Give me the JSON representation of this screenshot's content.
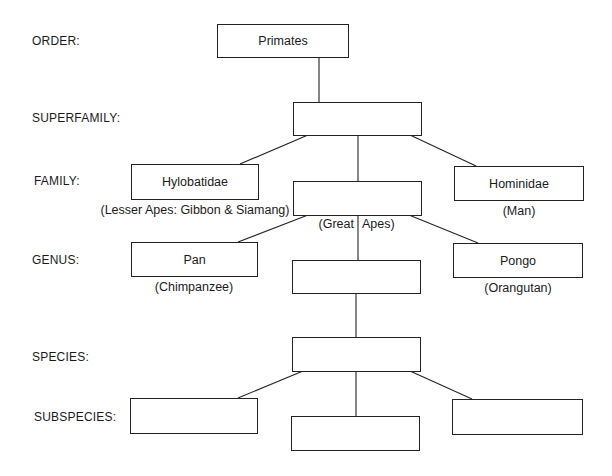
{
  "ranks": [
    {
      "id": "order",
      "label": "ORDER:"
    },
    {
      "id": "superfamily",
      "label": "SUPERFAMILY:"
    },
    {
      "id": "family",
      "label": "FAMILY:"
    },
    {
      "id": "genus",
      "label": "GENUS:"
    },
    {
      "id": "species",
      "label": "SPECIES:"
    },
    {
      "id": "subspecies",
      "label": "SUBSPECIES:"
    }
  ],
  "nodes": {
    "primates": {
      "label": "Primates",
      "caption": ""
    },
    "superfamily": {
      "label": "",
      "caption": ""
    },
    "hylobatidae": {
      "label": "Hylobatidae",
      "caption": "(Lesser Apes: Gibbon & Siamang)"
    },
    "great_apes": {
      "label": "",
      "caption_left": "(Great",
      "caption_right": "Apes)"
    },
    "hominidae": {
      "label": "Hominidae",
      "caption": "(Man)"
    },
    "pan": {
      "label": "Pan",
      "caption": "(Chimpanzee)"
    },
    "genus_blank": {
      "label": "",
      "caption": ""
    },
    "pongo": {
      "label": "Pongo",
      "caption": "(Orangutan)"
    },
    "species_blank": {
      "label": "",
      "caption": ""
    },
    "subspecies_left": {
      "label": "",
      "caption": ""
    },
    "subspecies_middle": {
      "label": "",
      "caption": ""
    },
    "subspecies_right": {
      "label": "",
      "caption": ""
    }
  }
}
